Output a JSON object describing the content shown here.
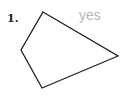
{
  "problem": {
    "number": "1.",
    "answer": "yes",
    "answer_color": "#b5b5b5",
    "shape": {
      "type": "quadrilateral",
      "vertices": [
        [
          43,
          12
        ],
        [
          118,
          56
        ],
        [
          42,
          88
        ],
        [
          21,
          50
        ]
      ],
      "stroke": "#222222"
    }
  }
}
